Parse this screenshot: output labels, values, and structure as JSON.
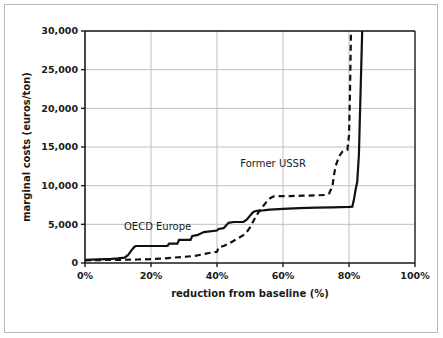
{
  "figure": {
    "background_color": "#ffffff",
    "border_color": "#b9b9b9",
    "axis_color": "#1a1a1a",
    "grid_color": "#c0c0c0"
  },
  "chart_data": {
    "type": "line",
    "title": "",
    "subtitle": "",
    "xlabel": "reduction from baseline (%)",
    "ylabel": "marginal costs (euros/ton)",
    "xlim": [
      0,
      100
    ],
    "ylim": [
      0,
      30000
    ],
    "xticks": [
      0,
      20,
      40,
      60,
      80,
      100
    ],
    "xticklabels": [
      "0%",
      "20%",
      "40%",
      "60%",
      "80%",
      "100%"
    ],
    "yticks": [
      0,
      5000,
      10000,
      15000,
      20000,
      25000,
      30000
    ],
    "yticklabels": [
      "0",
      "5,000",
      "10,000",
      "15,000",
      "20,000",
      "25,000",
      "30,000"
    ],
    "grid": "horizontal-and-vertical",
    "legend_position": "inline-annotations",
    "series": [
      {
        "name": "OECD Europe",
        "style": "solid",
        "color": "#111111",
        "linewidth": 2.2,
        "label_x": 22,
        "label_y": 4300,
        "points": [
          [
            0,
            400
          ],
          [
            2,
            430
          ],
          [
            4,
            470
          ],
          [
            6,
            500
          ],
          [
            8,
            540
          ],
          [
            10,
            600
          ],
          [
            12,
            700
          ],
          [
            13,
            1000
          ],
          [
            14,
            1600
          ],
          [
            15,
            2100
          ],
          [
            15.5,
            2200
          ],
          [
            25,
            2200
          ],
          [
            25.5,
            2500
          ],
          [
            28,
            2500
          ],
          [
            28.5,
            3000
          ],
          [
            32,
            3000
          ],
          [
            32.5,
            3500
          ],
          [
            34,
            3600
          ],
          [
            36,
            4000
          ],
          [
            40,
            4200
          ],
          [
            40.5,
            4400
          ],
          [
            42,
            4500
          ],
          [
            43.5,
            5200
          ],
          [
            45,
            5300
          ],
          [
            48,
            5300
          ],
          [
            49,
            5600
          ],
          [
            50,
            6100
          ],
          [
            51,
            6600
          ],
          [
            52,
            6750
          ],
          [
            54,
            6800
          ],
          [
            56,
            6900
          ],
          [
            60,
            7000
          ],
          [
            65,
            7100
          ],
          [
            70,
            7150
          ],
          [
            75,
            7200
          ],
          [
            80,
            7250
          ],
          [
            81,
            7280
          ],
          [
            81.5,
            8200
          ],
          [
            82,
            9500
          ],
          [
            82.5,
            10500
          ],
          [
            83,
            14000
          ],
          [
            83.5,
            22000
          ],
          [
            84,
            30000
          ]
        ]
      },
      {
        "name": "Former USSR",
        "style": "dashed",
        "color": "#111111",
        "linewidth": 2.2,
        "label_x": 57,
        "label_y": 12400,
        "points": [
          [
            0,
            350
          ],
          [
            4,
            380
          ],
          [
            8,
            400
          ],
          [
            12,
            420
          ],
          [
            16,
            450
          ],
          [
            20,
            500
          ],
          [
            24,
            600
          ],
          [
            27,
            700
          ],
          [
            30,
            800
          ],
          [
            33,
            900
          ],
          [
            36,
            1150
          ],
          [
            39,
            1400
          ],
          [
            40,
            1450
          ],
          [
            40.5,
            2050
          ],
          [
            42,
            2200
          ],
          [
            44,
            2600
          ],
          [
            46,
            3100
          ],
          [
            48,
            3600
          ],
          [
            49,
            4000
          ],
          [
            50,
            4600
          ],
          [
            51,
            5400
          ],
          [
            52,
            6200
          ],
          [
            53.5,
            7100
          ],
          [
            55,
            7900
          ],
          [
            56,
            8350
          ],
          [
            57,
            8600
          ],
          [
            58,
            8650
          ],
          [
            62,
            8650
          ],
          [
            66,
            8700
          ],
          [
            70,
            8750
          ],
          [
            73,
            8800
          ],
          [
            74,
            9000
          ],
          [
            75,
            10000
          ],
          [
            75.5,
            11500
          ],
          [
            76,
            12600
          ],
          [
            77,
            13800
          ],
          [
            78,
            14400
          ],
          [
            79,
            14500
          ],
          [
            79.5,
            14600
          ],
          [
            80,
            16500
          ],
          [
            80.3,
            22000
          ],
          [
            80.6,
            30000
          ]
        ]
      }
    ]
  }
}
